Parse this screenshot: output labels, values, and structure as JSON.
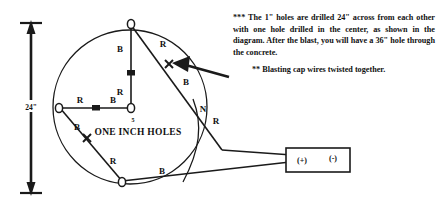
{
  "diagram": {
    "dimension": {
      "label": "24\"",
      "name": "overall-diameter"
    },
    "caption": {
      "count": "5",
      "text": "ONE INCH HOLES"
    },
    "holes": [
      {
        "id": "hole-top",
        "name": "top-hole"
      },
      {
        "id": "hole-center",
        "name": "center-hole"
      },
      {
        "id": "hole-left",
        "name": "left-hole"
      },
      {
        "id": "hole-bottom",
        "name": "bottom-hole"
      }
    ],
    "leg_labels": {
      "top_b": "B",
      "top_r": "R",
      "center_r": "R",
      "center_b": "B",
      "left_r": "R",
      "left_b": "B",
      "bottom_r": "R",
      "bottom_b": "B",
      "diag_r": "R",
      "diag_b": "B",
      "lead_n": "N",
      "lead_r": "R",
      "node_n": "N"
    },
    "connector_box": {
      "positive": "(+)",
      "negative": "(-)"
    },
    "colors": {
      "ink": "#1a1a1a",
      "paper": "#ffffff"
    }
  },
  "notes": {
    "primary": "*** The 1\" holes are drilled 24\" across from each other with one hole drilled in the center, as shown in the diagram. After the blast, you will have a 36\" hole through the concrete.",
    "secondary": "** Blasting cap wires twisted together."
  }
}
